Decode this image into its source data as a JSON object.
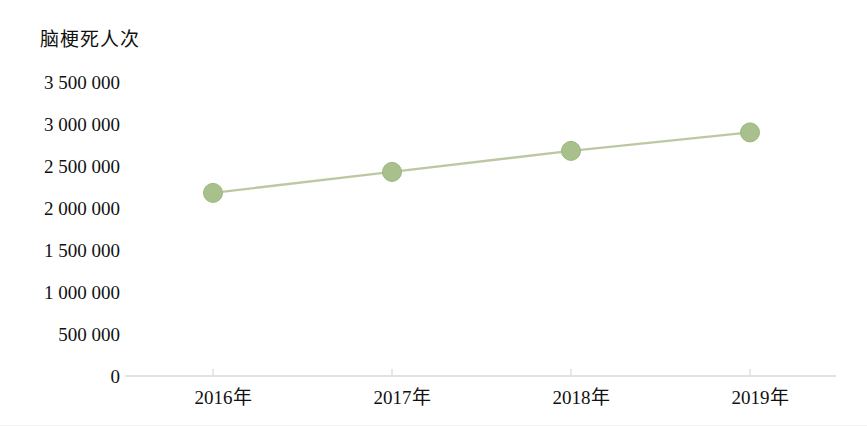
{
  "chart_data": {
    "type": "line",
    "title": "脑梗死人次",
    "xlabel": "",
    "ylabel": "脑梗死人次",
    "categories": [
      "2016年",
      "2017年",
      "2018年",
      "2019年"
    ],
    "values": [
      2180000,
      2430000,
      2680000,
      2900000
    ],
    "series": [
      {
        "name": "脑梗死人次",
        "values": [
          2180000,
          2430000,
          2680000,
          2900000
        ]
      }
    ],
    "ylim": [
      0,
      3500000
    ],
    "ytick_values": [
      3500000,
      3000000,
      2500000,
      2000000,
      1500000,
      1000000,
      500000,
      0
    ],
    "ytick_labels": [
      "3 500 000",
      "3 000 000",
      "2 500 000",
      "2 000 000",
      "1 500 000",
      "1 000 000",
      "500 000",
      "0"
    ],
    "grid": false,
    "legend": "none",
    "marker": "circle",
    "line_color": "#bcc8a4",
    "marker_color": "#a8c08c",
    "marker_edge_color": "#9bb57d",
    "axis_color": "#d9d9d9",
    "text_color": "#111111",
    "background": "#ffffff"
  }
}
